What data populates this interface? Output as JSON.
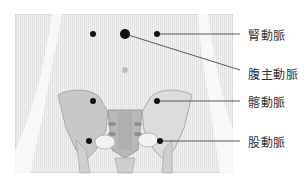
{
  "diagram": {
    "type": "anatomical-pulse-points",
    "labels": [
      {
        "id": "renal",
        "text": "腎動脈"
      },
      {
        "id": "aorta",
        "text": "腹主動脈"
      },
      {
        "id": "iliac",
        "text": "髂動脈"
      },
      {
        "id": "femoral",
        "text": "股動脈"
      }
    ],
    "points": [
      {
        "name": "left-renal-point",
        "x": 93,
        "y": 34
      },
      {
        "name": "aorta-point",
        "x": 125,
        "y": 34
      },
      {
        "name": "right-renal-point",
        "x": 157,
        "y": 34
      },
      {
        "name": "navel",
        "x": 125,
        "y": 69
      },
      {
        "name": "left-iliac-point",
        "x": 93,
        "y": 101
      },
      {
        "name": "right-iliac-point",
        "x": 157,
        "y": 101
      },
      {
        "name": "left-femoral-point",
        "x": 89,
        "y": 141
      },
      {
        "name": "right-femoral-point",
        "x": 160,
        "y": 141
      }
    ]
  }
}
